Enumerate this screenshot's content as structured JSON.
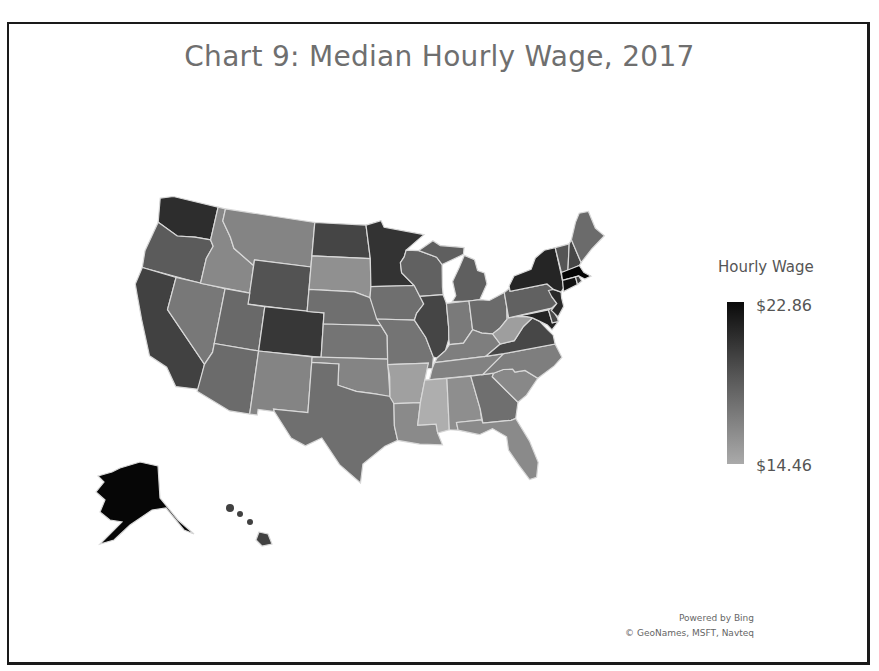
{
  "chart_data": {
    "type": "choropleth",
    "title": "Chart 9: Median Hourly Wage, 2017",
    "legend": {
      "title": "Hourly Wage",
      "max_label": "$22.86",
      "min_label": "$14.46",
      "max": 22.86,
      "min": 14.46,
      "position": "right"
    },
    "credits": [
      "Powered by Bing",
      "© GeoNames, MSFT, Navteq"
    ],
    "regions": {
      "WA": 20.9,
      "OR": 18.6,
      "CA": 19.9,
      "NV": 17.2,
      "ID": 16.4,
      "MT": 16.6,
      "WY": 19.0,
      "UT": 17.9,
      "AZ": 17.8,
      "CO": 20.4,
      "NM": 16.6,
      "ND": 19.7,
      "SD": 16.0,
      "NE": 17.6,
      "KS": 17.4,
      "OK": 16.6,
      "TX": 17.6,
      "MN": 20.6,
      "IA": 17.6,
      "MO": 17.4,
      "AR": 15.2,
      "LA": 16.3,
      "WI": 18.3,
      "IL": 19.7,
      "MI": 18.4,
      "IN": 17.1,
      "OH": 17.8,
      "KY": 16.9,
      "TN": 16.7,
      "MS": 14.5,
      "AL": 16.1,
      "GA": 17.6,
      "FL": 16.3,
      "SC": 16.4,
      "NC": 16.9,
      "VA": 19.6,
      "WV": 15.3,
      "PA": 18.3,
      "NY": 21.3,
      "VT": 18.9,
      "NH": 19.6,
      "ME": 17.8,
      "MA": 22.86,
      "CT": 22.2,
      "RI": 20.2,
      "NJ": 21.1,
      "DE": 19.6,
      "MD": 21.4,
      "AK": 22.8,
      "HI": 19.9
    }
  }
}
